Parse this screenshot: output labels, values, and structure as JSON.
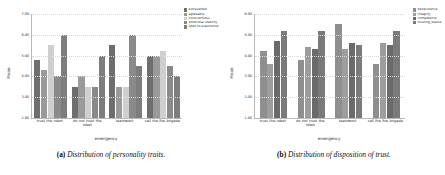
{
  "figures": [
    {
      "key": "a",
      "caption_label": "(a)",
      "caption_text": "Distribution of personality traits.",
      "chart_data": {
        "type": "bar",
        "title": "",
        "xlabel": "emergency",
        "ylabel": "Mean",
        "ylim": [
          2.0,
          7.0
        ],
        "yticks": [
          "7.00",
          "6.00",
          "5.00",
          "4.00",
          "3.00",
          "2.00"
        ],
        "grid": true,
        "legend_position": "upper right",
        "categories": [
          "trust the robot",
          "do not trust the robot",
          "teamwork",
          "call the fire brigade"
        ],
        "series": [
          {
            "name": "extraverted",
            "color": "#6e6e6e",
            "values": [
              4.8,
              3.5,
              5.5,
              5.0
            ]
          },
          {
            "name": "agreeable",
            "color": "#9a9a9a",
            "values": [
              4.3,
              4.0,
              3.5,
              5.0
            ]
          },
          {
            "name": "conscientious",
            "color": "#cfcfcf",
            "values": [
              5.5,
              3.5,
              3.5,
              5.2
            ]
          },
          {
            "name": "emotional stability",
            "color": "#8a8a8a",
            "values": [
              4.0,
              3.5,
              6.0,
              4.5
            ]
          },
          {
            "name": "open to experience",
            "color": "#7d7d7d",
            "values": [
              6.0,
              5.0,
              4.5,
              4.0
            ]
          }
        ]
      }
    },
    {
      "key": "b",
      "caption_label": "(b)",
      "caption_text": "Distribution of disposition of trust.",
      "chart_data": {
        "type": "bar",
        "title": "",
        "xlabel": "emergency",
        "ylabel": "Mean",
        "ylim": [
          1.0,
          6.0
        ],
        "yticks": [
          "6.00",
          "5.00",
          "4.00",
          "3.00",
          "2.00",
          "1.00"
        ],
        "grid": true,
        "legend_position": "upper right",
        "categories": [
          "trust the robot",
          "do not trust the robot",
          "teamwork",
          "call the fire brigade"
        ],
        "series": [
          {
            "name": "benevolence",
            "color": "#8f8f8f",
            "values": [
              4.2,
              3.8,
              5.5,
              3.6
            ]
          },
          {
            "name": "integrity",
            "color": "#9d9d9d",
            "values": [
              3.6,
              4.4,
              4.3,
              4.6
            ]
          },
          {
            "name": "competence",
            "color": "#6a6a6a",
            "values": [
              4.7,
              4.3,
              4.6,
              4.5
            ]
          },
          {
            "name": "trusting_stance",
            "color": "#7a7a7a",
            "values": [
              5.2,
              5.2,
              4.5,
              5.2
            ]
          }
        ]
      }
    }
  ]
}
